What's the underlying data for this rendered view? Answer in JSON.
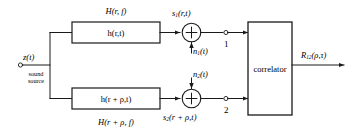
{
  "diagram": {
    "stroke_color": "#1a1a1a",
    "background_color": "#ffffff",
    "input": {
      "signal_label": "z(t)",
      "source_line1": "sound",
      "source_line2": "source"
    },
    "upper_channel": {
      "transfer_function_label": "H(r, f)",
      "impulse_response_label": "h(r,t)",
      "output_signal_label": "s",
      "output_signal_sub": "1",
      "output_signal_rest": "(r,t)",
      "noise_label": "n",
      "noise_sub": "1",
      "noise_rest": "(t)",
      "terminal_number": "1"
    },
    "lower_channel": {
      "transfer_function_label": "H(r + ρ, f)",
      "impulse_response_label": "h(r + ρ,t)",
      "output_signal_label": "s",
      "output_signal_sub": "2",
      "output_signal_rest": "(r + ρ,t)",
      "noise_label": "n",
      "noise_sub": "2",
      "noise_rest": "(t)",
      "terminal_number": "2"
    },
    "correlator": {
      "label": "correlator",
      "output_label": "R",
      "output_sub": "12",
      "output_rest": "(ρ,τ)"
    },
    "adder": {
      "symbol": "+"
    }
  }
}
